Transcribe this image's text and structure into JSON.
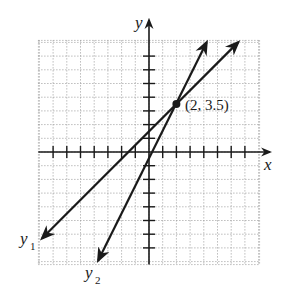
{
  "chart_data": {
    "type": "line",
    "title": "",
    "xlabel": "x",
    "ylabel": "y",
    "xlim": [
      -8,
      8
    ],
    "ylim": [
      -8,
      8
    ],
    "grid": true,
    "grid_style": "dotted",
    "tick_spacing": 1,
    "series": [
      {
        "name": "y1",
        "label": "y1",
        "equation": "y = x + 1.5",
        "slope": 1,
        "intercept": 1.5,
        "x": [
          -7.8,
          6.5
        ],
        "y": [
          -6.3,
          8.0
        ]
      },
      {
        "name": "y2",
        "label": "y2",
        "equation": "y = 2x - 0.5",
        "slope": 2,
        "intercept": -0.5,
        "x": [
          -3.7,
          4.2
        ],
        "y": [
          -7.9,
          8.0
        ]
      }
    ],
    "annotations": [
      {
        "type": "point",
        "x": 2,
        "y": 3.5,
        "label": "(2, 3.5)"
      }
    ]
  },
  "labels": {
    "x_axis": "x",
    "y_axis": "y",
    "y1_main": "y",
    "y1_sub": "1",
    "y2_main": "y",
    "y2_sub": "2",
    "intersection": "(2, 3.5)"
  },
  "colors": {
    "ink": "#1a1a1a",
    "grid": "#9a9a9a",
    "background": "#ffffff"
  }
}
